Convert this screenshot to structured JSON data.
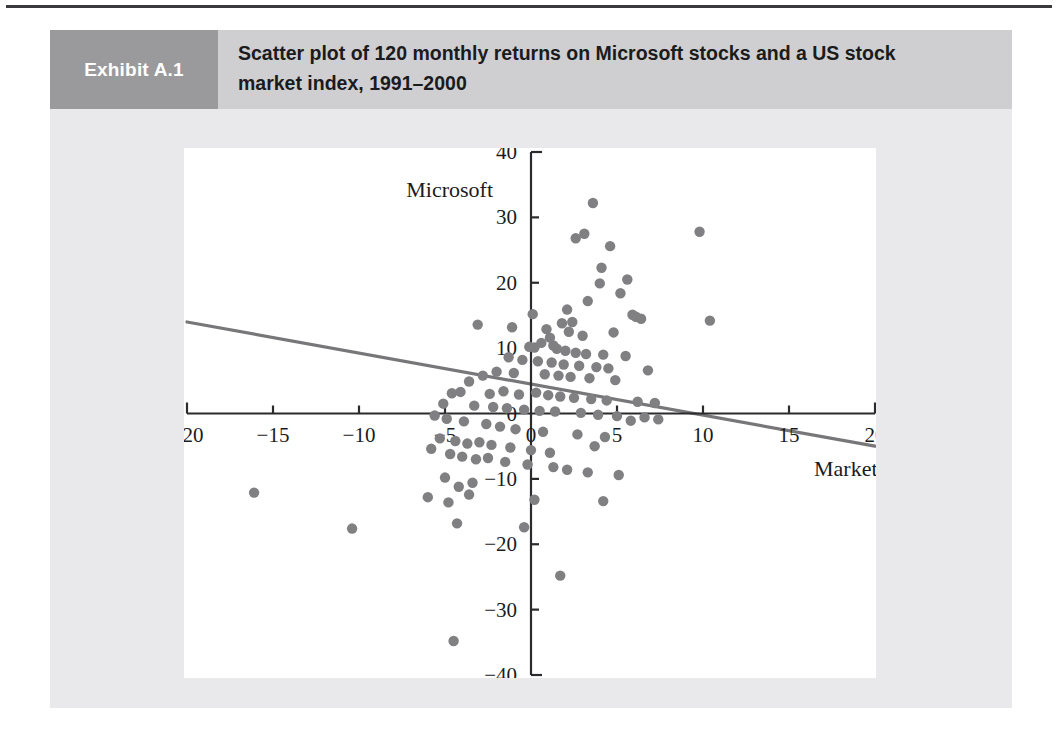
{
  "exhibit": {
    "number_label": "Exhibit A.1",
    "title": "Scatter plot of 120 monthly returns on Microsoft stocks and a US stock market index, 1991–2000"
  },
  "colors": {
    "panel_background": "#e9e9eb",
    "header_background": "#cfcfd1",
    "number_box_background": "#9a9a9c",
    "number_text": "#ffffff",
    "plot_background": "#ffffff",
    "axis": "#2b2b2d",
    "point": "#808083",
    "regression_line": "#77777a",
    "top_rule": "#3a3a3c"
  },
  "chart_data": {
    "type": "scatter",
    "title": "Scatter plot of 120 monthly returns on Microsoft stocks and a US stock market index, 1991–2000",
    "xlabel": "Market",
    "ylabel": "Microsoft",
    "xlim": [
      -20,
      20
    ],
    "ylim": [
      -40,
      40
    ],
    "xticks": [
      -20,
      -15,
      -10,
      -5,
      0,
      5,
      10,
      15,
      20
    ],
    "xtick_labels": [
      "−20",
      "−15",
      "−10",
      "−5",
      "0",
      "5",
      "10",
      "15",
      "20"
    ],
    "yticks": [
      -40,
      -30,
      -20,
      -10,
      0,
      10,
      20,
      30,
      40
    ],
    "ytick_labels": [
      "−40",
      "−30",
      "−20",
      "−10",
      "0",
      "10",
      "20",
      "30",
      "40"
    ],
    "grid": false,
    "legend": null,
    "n_points": 120,
    "axis_style": "crossed-at-origin",
    "trendline": {
      "type": "linear",
      "x_start": -20,
      "y_start": 14.0,
      "x_end": 20,
      "y_end": -5.0
    },
    "points": [
      [
        3.6,
        32.2
      ],
      [
        3.1,
        27.5
      ],
      [
        9.8,
        27.8
      ],
      [
        2.6,
        26.8
      ],
      [
        4.6,
        25.6
      ],
      [
        4.1,
        22.3
      ],
      [
        5.6,
        20.5
      ],
      [
        4.0,
        19.9
      ],
      [
        5.2,
        18.4
      ],
      [
        3.3,
        17.2
      ],
      [
        2.1,
        15.9
      ],
      [
        5.9,
        15.1
      ],
      [
        6.1,
        14.8
      ],
      [
        6.4,
        14.5
      ],
      [
        10.4,
        14.2
      ],
      [
        -1.1,
        13.2
      ],
      [
        -3.1,
        13.6
      ],
      [
        1.8,
        13.8
      ],
      [
        0.1,
        15.2
      ],
      [
        2.4,
        14.0
      ],
      [
        0.9,
        12.9
      ],
      [
        2.2,
        12.5
      ],
      [
        4.8,
        12.4
      ],
      [
        3.0,
        11.9
      ],
      [
        1.1,
        11.6
      ],
      [
        -0.1,
        10.2
      ],
      [
        0.2,
        10.1
      ],
      [
        0.6,
        10.8
      ],
      [
        1.3,
        10.4
      ],
      [
        1.5,
        9.9
      ],
      [
        2.0,
        9.6
      ],
      [
        2.6,
        9.3
      ],
      [
        3.2,
        9.1
      ],
      [
        4.2,
        9.0
      ],
      [
        5.5,
        8.8
      ],
      [
        -1.3,
        8.6
      ],
      [
        -0.5,
        8.2
      ],
      [
        0.4,
        8.0
      ],
      [
        1.2,
        7.8
      ],
      [
        1.9,
        7.5
      ],
      [
        2.8,
        7.3
      ],
      [
        3.8,
        7.1
      ],
      [
        4.5,
        6.9
      ],
      [
        6.8,
        6.6
      ],
      [
        -2.0,
        6.4
      ],
      [
        -1.0,
        6.2
      ],
      [
        0.8,
        6.0
      ],
      [
        1.6,
        5.8
      ],
      [
        2.3,
        5.6
      ],
      [
        3.4,
        5.4
      ],
      [
        4.9,
        5.1
      ],
      [
        -2.8,
        5.8
      ],
      [
        -3.6,
        4.9
      ],
      [
        -4.6,
        3.1
      ],
      [
        -4.1,
        3.3
      ],
      [
        -2.4,
        3.0
      ],
      [
        -1.6,
        3.4
      ],
      [
        -0.7,
        2.9
      ],
      [
        0.3,
        3.2
      ],
      [
        1.0,
        2.8
      ],
      [
        1.7,
        2.6
      ],
      [
        2.5,
        2.4
      ],
      [
        3.5,
        2.2
      ],
      [
        4.4,
        2.0
      ],
      [
        6.2,
        1.8
      ],
      [
        7.2,
        1.6
      ],
      [
        -5.1,
        1.5
      ],
      [
        -3.3,
        1.2
      ],
      [
        -2.2,
        1.0
      ],
      [
        -1.4,
        0.8
      ],
      [
        -0.4,
        0.6
      ],
      [
        0.5,
        0.4
      ],
      [
        1.4,
        0.3
      ],
      [
        2.9,
        0.1
      ],
      [
        3.9,
        -0.2
      ],
      [
        5.0,
        -0.4
      ],
      [
        6.6,
        -0.6
      ],
      [
        7.4,
        -0.9
      ],
      [
        -5.6,
        -0.3
      ],
      [
        -4.9,
        -0.8
      ],
      [
        -3.9,
        -1.2
      ],
      [
        -2.6,
        -1.6
      ],
      [
        -1.8,
        -2.0
      ],
      [
        -0.9,
        -2.4
      ],
      [
        0.7,
        -2.8
      ],
      [
        2.7,
        -3.2
      ],
      [
        4.3,
        -3.6
      ],
      [
        5.8,
        -1.1
      ],
      [
        -5.3,
        -3.8
      ],
      [
        -4.4,
        -4.2
      ],
      [
        -3.7,
        -4.6
      ],
      [
        -3.0,
        -4.4
      ],
      [
        -2.3,
        -4.8
      ],
      [
        -1.2,
        -5.2
      ],
      [
        0.0,
        -5.6
      ],
      [
        1.1,
        -6.0
      ],
      [
        3.7,
        -5.0
      ],
      [
        -5.8,
        -5.4
      ],
      [
        -4.7,
        -6.2
      ],
      [
        -4.0,
        -6.6
      ],
      [
        -3.2,
        -7.0
      ],
      [
        -2.5,
        -6.8
      ],
      [
        -1.5,
        -7.4
      ],
      [
        -0.2,
        -7.8
      ],
      [
        1.3,
        -8.2
      ],
      [
        2.1,
        -8.6
      ],
      [
        3.3,
        -9.0
      ],
      [
        5.1,
        -9.4
      ],
      [
        -5.0,
        -9.8
      ],
      [
        -4.2,
        -11.2
      ],
      [
        -3.4,
        -10.6
      ],
      [
        -6.0,
        -12.8
      ],
      [
        -4.8,
        -13.6
      ],
      [
        -3.6,
        -12.4
      ],
      [
        0.2,
        -13.2
      ],
      [
        4.2,
        -13.4
      ],
      [
        -0.4,
        -17.4
      ],
      [
        -4.3,
        -16.8
      ],
      [
        -16.1,
        -12.1
      ],
      [
        -10.4,
        -17.6
      ],
      [
        1.7,
        -24.8
      ],
      [
        -4.5,
        -34.8
      ]
    ]
  }
}
